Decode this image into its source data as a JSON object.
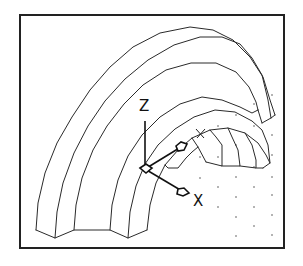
{
  "drawing": {
    "description": "3D wireframe of a half ring/flange part with UCS icon",
    "ucs_icon": {
      "z_label": "Z",
      "x_label": "X",
      "y_label": "Y"
    },
    "colors": {
      "line": "#2a2a2a",
      "background": "#ffffff",
      "frame": "#222222"
    }
  }
}
